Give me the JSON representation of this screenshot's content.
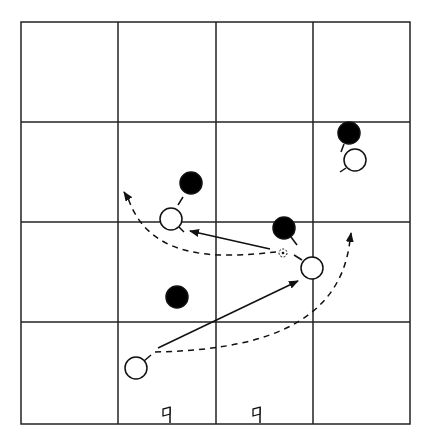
{
  "diagram": {
    "title": "Soccer drill diagram",
    "type": "tactics-grid",
    "colors": {
      "background": "#ffffff",
      "line": "#222222",
      "defender_fill": "#000000",
      "attacker_fill": "#ffffff"
    },
    "grid": {
      "left": 21,
      "top": 22,
      "right": 410,
      "bottom": 424,
      "vertical_lines": [
        118,
        216,
        313
      ],
      "horizontal_lines": [
        122,
        222,
        322
      ],
      "rows": 4,
      "cols": 4
    },
    "defenders": [
      {
        "id": "d1",
        "x": 191,
        "y": 183,
        "r": 11,
        "stick": [
          183,
          197,
          178,
          205
        ]
      },
      {
        "id": "d2",
        "x": 284,
        "y": 228,
        "r": 11,
        "stick": [
          291,
          237,
          297,
          245
        ]
      },
      {
        "id": "d3",
        "x": 177,
        "y": 297,
        "r": 11,
        "stick": null
      },
      {
        "id": "d4",
        "x": 349,
        "y": 133,
        "r": 11,
        "stick": [
          344,
          144,
          341,
          152
        ]
      }
    ],
    "attackers": [
      {
        "id": "a1",
        "x": 171,
        "y": 219,
        "r": 11,
        "stick": [
          179,
          227,
          184,
          232
        ]
      },
      {
        "id": "a2",
        "x": 312,
        "y": 268,
        "r": 11,
        "stick": [
          302,
          260,
          294,
          255
        ]
      },
      {
        "id": "a3",
        "x": 355,
        "y": 160,
        "r": 11,
        "stick": [
          346,
          168,
          340,
          172
        ]
      },
      {
        "id": "a4",
        "x": 136,
        "y": 368,
        "r": 11,
        "stick": [
          144,
          361,
          151,
          355
        ]
      }
    ],
    "ball": {
      "x": 283,
      "y": 253,
      "r": 4
    },
    "pass_arrows": [
      {
        "id": "pass-1",
        "from": [
          270,
          249
        ],
        "to": [
          190,
          231
        ]
      },
      {
        "id": "pass-2",
        "from": [
          158,
          348
        ],
        "to": [
          298,
          281
        ]
      }
    ],
    "run_arrows": [
      {
        "id": "run-1",
        "path": "M 276 252 C 220 258, 150 262, 128 198",
        "head": [
          124,
          192
        ]
      },
      {
        "id": "run-2",
        "path": "M 155 352 C 250 350, 340 330, 350 240",
        "head": [
          351,
          233
        ]
      }
    ],
    "flags": [
      {
        "id": "flag-left",
        "x": 170,
        "y": 423
      },
      {
        "id": "flag-right",
        "x": 260,
        "y": 423
      }
    ]
  }
}
